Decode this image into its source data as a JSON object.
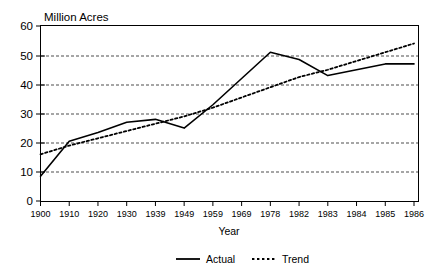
{
  "chart_data": {
    "type": "line",
    "title": "",
    "unit_label": "Million Acres",
    "xlabel": "Year",
    "ylabel": "",
    "ylim": [
      0,
      60
    ],
    "yticks": [
      0,
      10,
      20,
      30,
      40,
      50,
      60
    ],
    "grid": true,
    "grid_axis": "y",
    "legend_position": "bottom-center",
    "categories": [
      "1900",
      "1910",
      "1920",
      "1930",
      "1939",
      "1949",
      "1959",
      "1969",
      "1978",
      "1982",
      "1983",
      "1984",
      "1985",
      "1986"
    ],
    "series": [
      {
        "name": "Actual",
        "style": "solid",
        "color": "#000000",
        "values": [
          8.5,
          20.5,
          23.5,
          27,
          28,
          25,
          33,
          42,
          51,
          48.5,
          43,
          45,
          47,
          47
        ]
      },
      {
        "name": "Trend",
        "style": "dotted",
        "color": "#000000",
        "values": [
          16,
          19,
          21.5,
          24,
          26.5,
          29,
          32,
          35.5,
          39,
          42.5,
          45,
          48,
          51,
          54
        ]
      }
    ]
  },
  "legend": {
    "items": [
      {
        "label": "Actual",
        "style": "solid"
      },
      {
        "label": "Trend",
        "style": "dotted"
      }
    ]
  },
  "axes": {
    "y_tick_labels": [
      "60",
      "50",
      "40",
      "30",
      "20",
      "10",
      "0"
    ],
    "x_tick_labels": [
      "1900",
      "1910",
      "1920",
      "1930",
      "1939",
      "1949",
      "1959",
      "1969",
      "1978",
      "1982",
      "1983",
      "1984",
      "1985",
      "1986"
    ],
    "x_axis_title": "Year",
    "y_unit_caption": "Million Acres"
  }
}
